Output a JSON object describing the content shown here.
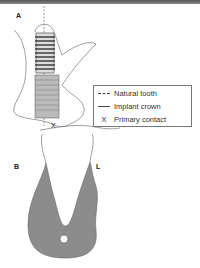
{
  "panel_labels": {
    "a": "A",
    "b": "B",
    "l": "L"
  },
  "legend": {
    "items": [
      {
        "symbol": "dashed-line",
        "label": "Natural tooth"
      },
      {
        "symbol": "solid-line",
        "label": "Implant crown"
      },
      {
        "symbol": "X",
        "label": "Primary contact"
      }
    ]
  },
  "colors": {
    "bone": "#8c8c8c",
    "outline": "#777777",
    "implant": "#bbbbbb"
  }
}
